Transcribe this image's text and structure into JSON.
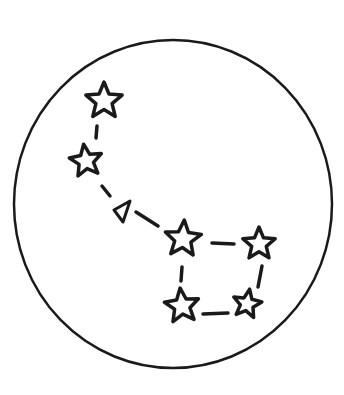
{
  "illustration": {
    "subject": "Big Dipper constellation in a circle",
    "ink_color": "#1a1a1a",
    "background_color": "#ffffff",
    "frame": {
      "shape": "circle",
      "cx": 173,
      "cy": 204,
      "rx": 159,
      "ry": 164,
      "stroke_width": 2.5
    },
    "stars": [
      {
        "id": "star-1",
        "cx": 104,
        "cy": 101,
        "r": 19,
        "rotation": 0
      },
      {
        "id": "star-2",
        "cx": 86,
        "cy": 161,
        "r": 17,
        "rotation": -8
      },
      {
        "id": "star-3",
        "cx": 183,
        "cy": 239,
        "r": 19,
        "rotation": 4
      },
      {
        "id": "star-4",
        "cx": 259,
        "cy": 244,
        "r": 17,
        "rotation": 0
      },
      {
        "id": "star-5",
        "cx": 182,
        "cy": 306,
        "r": 18,
        "rotation": -6
      },
      {
        "id": "star-6",
        "cx": 247,
        "cy": 304,
        "r": 15,
        "rotation": 10
      }
    ],
    "triangle": {
      "id": "triangle-marker",
      "points": "114,210 130,201 123,222"
    },
    "dashes": [
      {
        "x1": 97,
        "y1": 126,
        "x2": 96,
        "y2": 138
      },
      {
        "x1": 102,
        "y1": 186,
        "x2": 110,
        "y2": 196
      },
      {
        "x1": 136,
        "y1": 212,
        "x2": 158,
        "y2": 226
      },
      {
        "x1": 212,
        "y1": 243,
        "x2": 234,
        "y2": 244
      },
      {
        "x1": 182,
        "y1": 267,
        "x2": 181,
        "y2": 281
      },
      {
        "x1": 262,
        "y1": 266,
        "x2": 258,
        "y2": 287
      },
      {
        "x1": 203,
        "y1": 314,
        "x2": 228,
        "y2": 313
      }
    ]
  }
}
